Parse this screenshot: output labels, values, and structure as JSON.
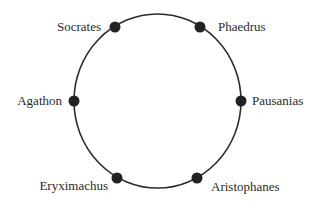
{
  "diagram": {
    "type": "seating-circle",
    "line_color": "#2b2b2b",
    "node_color": "#222222",
    "circle": {
      "cx": 157.5,
      "cy": 101,
      "rx": 83.5,
      "ry": 87
    },
    "nodes": [
      {
        "id": "socrates",
        "label": "Socrates",
        "x": 115,
        "y": 27,
        "label_x": 101,
        "label_y": 31,
        "anchor": "end"
      },
      {
        "id": "phaedrus",
        "label": "Phaedrus",
        "x": 200,
        "y": 27,
        "label_x": 218,
        "label_y": 31,
        "anchor": "start"
      },
      {
        "id": "agathon",
        "label": "Agathon",
        "x": 74,
        "y": 101,
        "label_x": 62,
        "label_y": 105,
        "anchor": "end"
      },
      {
        "id": "pausanias",
        "label": "Pausanias",
        "x": 241,
        "y": 101,
        "label_x": 252,
        "label_y": 105,
        "anchor": "start"
      },
      {
        "id": "eryximachus",
        "label": "Eryximachus",
        "x": 117,
        "y": 178,
        "label_x": 108,
        "label_y": 190,
        "anchor": "end"
      },
      {
        "id": "aristophanes",
        "label": "Aristophanes",
        "x": 197,
        "y": 178,
        "label_x": 211,
        "label_y": 191,
        "anchor": "start"
      }
    ]
  }
}
